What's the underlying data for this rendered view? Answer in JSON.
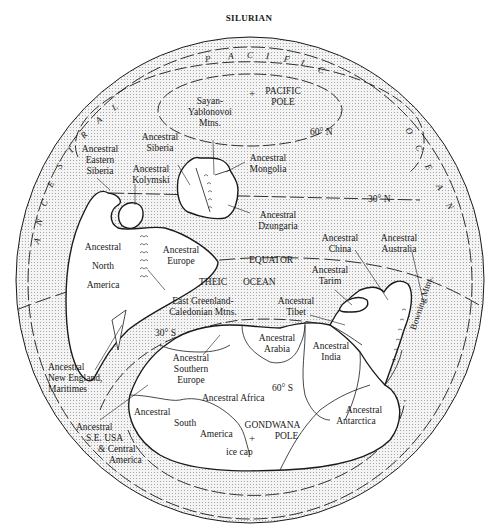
{
  "title": "SILURIAN",
  "colors": {
    "ocean_fill": "#ececec",
    "land_fill": "#ffffff",
    "ink": "#1a1a1a",
    "background": "#ffffff"
  },
  "oceans": {
    "pacific": {
      "letters": [
        "P",
        "A",
        "C",
        "I",
        "F",
        "I",
        "C"
      ]
    },
    "pacific_ocean_right": {
      "letters": [
        "O",
        "C",
        "E",
        "A",
        "N"
      ]
    },
    "ancestral_left": {
      "letters": [
        "A",
        "N",
        "C",
        "E",
        "S",
        "T",
        "R",
        "A",
        "L"
      ]
    },
    "theic": "THEIC",
    "theic_ocean": "OCEAN"
  },
  "poles": {
    "pacific_pole": [
      "PACIFIC",
      "POLE"
    ],
    "gondwana_pole": [
      "GONDWANA",
      "POLE"
    ],
    "ice_cap": "ice cap",
    "marker": "+"
  },
  "latitudes": {
    "n60": "60° N",
    "n30": "30° N",
    "equator": "EQUATOR",
    "s30": "30° S",
    "s60": "60° S"
  },
  "labels": {
    "sayan": [
      "Sayan-",
      "Yablonovoi",
      "Mtns."
    ],
    "siberia": [
      "Ancestral",
      "Siberia"
    ],
    "eastern_siberia": [
      "Ancestral",
      "Eastern",
      "Siberia"
    ],
    "kolymski": [
      "Ancestral",
      "Kolymski"
    ],
    "mongolia": [
      "Ancestral",
      "Mongolia"
    ],
    "dzungaria": [
      "Ancestral",
      "Dzungaria"
    ],
    "north_america": [
      "Ancestral",
      "North",
      "America"
    ],
    "europe": [
      "Ancestral",
      "Europe"
    ],
    "east_greenland": [
      "East Greenland-",
      "Caledonian Mtns."
    ],
    "china": [
      "Ancestral",
      "China"
    ],
    "australia": [
      "Ancestral",
      "Australia"
    ],
    "tarim": [
      "Ancestral",
      "Tarim"
    ],
    "tibet": [
      "Ancestral",
      "Tibet"
    ],
    "arabia": [
      "Ancestral",
      "Arabia"
    ],
    "india": [
      "Ancestral",
      "India"
    ],
    "southern_europe": [
      "Ancestral",
      "Southern",
      "Europe"
    ],
    "new_england": [
      "Ancestral",
      "New England,",
      "Maritimes"
    ],
    "africa": "Ancestral Africa",
    "south_america": [
      "Ancestral",
      "South",
      "America"
    ],
    "se_usa": [
      "Ancestral",
      "S.E. USA",
      "& Central",
      "America"
    ],
    "antarctica": [
      "Ancestral",
      "Antarctica"
    ],
    "bowning": "Bowning Mtns."
  }
}
